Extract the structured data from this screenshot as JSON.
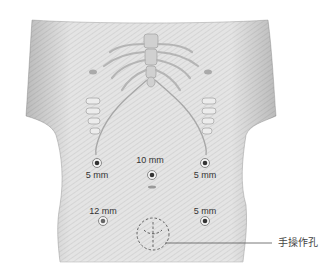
{
  "figure": {
    "ports": [
      {
        "id": "port-right-upper",
        "label": "5 mm",
        "x": 97,
        "y": 163,
        "label_x": 97,
        "label_y": 170
      },
      {
        "id": "port-umbilical",
        "label": "10 mm",
        "x": 152,
        "y": 175,
        "label_x": 150,
        "label_y": 155
      },
      {
        "id": "port-left-upper",
        "label": "5 mm",
        "x": 205,
        "y": 163,
        "label_x": 205,
        "label_y": 170
      },
      {
        "id": "port-right-lower",
        "label": "12 mm",
        "x": 103,
        "y": 221,
        "label_x": 103,
        "label_y": 206
      },
      {
        "id": "port-left-lower",
        "label": "5 mm",
        "x": 205,
        "y": 221,
        "label_x": 205,
        "label_y": 206
      }
    ],
    "hand_port": {
      "label": "手操作孔",
      "cx": 153,
      "cy": 234,
      "r": 16
    }
  },
  "colors": {
    "skin": "#e6e6e6",
    "skin_shadow": "#bdbdbd",
    "bone": "#d9d9d9",
    "port_ring": "#888888",
    "port_center": "#333333",
    "text": "#333333"
  }
}
